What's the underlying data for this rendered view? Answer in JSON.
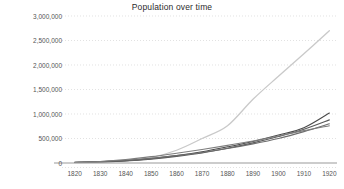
{
  "chart_data": {
    "type": "line",
    "title": "Population over time",
    "xlabel": "",
    "ylabel": "",
    "xlim": [
      1815,
      1923
    ],
    "ylim": [
      0,
      3000000
    ],
    "grid": true,
    "grid_style": "dotted-horizontal",
    "legend": "none",
    "background": "#ffffff",
    "x_ticks": [
      1820,
      1830,
      1840,
      1850,
      1860,
      1870,
      1880,
      1890,
      1900,
      1910,
      1920
    ],
    "x_tick_labels": [
      "1820",
      "1830",
      "1840",
      "1850",
      "1860",
      "1870",
      "1880",
      "1890",
      "1900",
      "1910",
      "1920"
    ],
    "y_ticks": [
      0,
      500000,
      1000000,
      1500000,
      2000000,
      2500000,
      3000000
    ],
    "y_tick_labels": [
      "0",
      "500,000",
      "1,000,000",
      "1,500,000",
      "2,000,000",
      "2,500,000",
      "3,000,000"
    ],
    "x": [
      1820,
      1830,
      1840,
      1850,
      1860,
      1870,
      1880,
      1890,
      1900,
      1910,
      1920
    ],
    "series": [
      {
        "name": "series-1",
        "color": "#c9c9c9",
        "width": 1.3,
        "values": [
          8000,
          20000,
          45000,
          110000,
          260000,
          500000,
          760000,
          1300000,
          1770000,
          2230000,
          2700000
        ]
      },
      {
        "name": "series-2",
        "color": "#4a4a4a",
        "width": 1.1,
        "values": [
          12000,
          25000,
          48000,
          90000,
          150000,
          230000,
          330000,
          440000,
          570000,
          720000,
          1020000
        ]
      },
      {
        "name": "series-3",
        "color": "#5a5a5a",
        "width": 1.1,
        "values": [
          10000,
          22000,
          42000,
          80000,
          135000,
          205000,
          300000,
          410000,
          540000,
          690000,
          880000
        ]
      },
      {
        "name": "series-4",
        "color": "#6d6d6d",
        "width": 1.1,
        "values": [
          14000,
          30000,
          55000,
          95000,
          150000,
          215000,
          295000,
          390000,
          500000,
          640000,
          800000
        ]
      },
      {
        "name": "series-5",
        "color": "#7d7d7d",
        "width": 1.1,
        "values": [
          9000,
          30000,
          70000,
          130000,
          200000,
          275000,
          360000,
          450000,
          550000,
          660000,
          760000
        ]
      }
    ],
    "colors": {
      "axis_line": "#9a9a9a",
      "grid_line": "#d6d6d6",
      "tick_text": "#555555",
      "title_text": "#2b2b2b"
    }
  },
  "plot_geometry": {
    "left": 62,
    "right": 337,
    "top": 16,
    "bottom": 163
  }
}
